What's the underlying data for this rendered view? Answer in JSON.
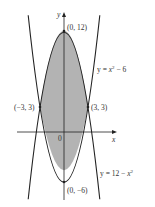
{
  "diagram": {
    "type": "region-between-curves",
    "curves": [
      {
        "equation": "y = x^2 - 6",
        "label_prefix": "y = ",
        "label_var": "x",
        "label_exp": "2",
        "label_suffix": " − 6"
      },
      {
        "equation": "y = 12 - x^2",
        "label_prefix": "y = 12 − ",
        "label_var": "x",
        "label_exp": "2",
        "label_suffix": ""
      }
    ],
    "axes": {
      "x_label": "x",
      "y_label": "y",
      "origin_label": "0"
    },
    "points": [
      {
        "label": "(0, 12)",
        "x": 0,
        "y": 12
      },
      {
        "label": "(−3, 3)",
        "x": -3,
        "y": 3
      },
      {
        "label": "(3, 3)",
        "x": 3,
        "y": 3
      },
      {
        "label": "(0, −6)",
        "x": 0,
        "y": -6
      }
    ],
    "shaded_region": "between y = 12 − x^2 (top) and y = x^2 − 6 (bottom), −3 ≤ x ≤ 3",
    "colors": {
      "fill": "#b3b3b3",
      "stroke": "#222222"
    }
  }
}
